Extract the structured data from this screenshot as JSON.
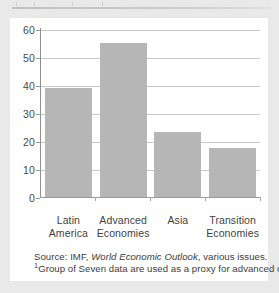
{
  "figure": {
    "background_color": "#e9e9e9",
    "panel_color": "#ffffff",
    "bar_color": "#b6b6b6",
    "gridline_color": "#c9c9c9",
    "axis_color": "#9b9b9b"
  },
  "notes": {
    "source_prefix": "Source: IMF, ",
    "source_title": "World Economic Outlook",
    "source_suffix": ", various issues.",
    "footnote_marker": "1",
    "footnote_text": "Group of Seven data are used as a proxy for advanced countries."
  },
  "chart_data": {
    "type": "bar",
    "title": "",
    "xlabel": "",
    "ylabel": "",
    "categories": [
      "Latin America",
      "Advanced Economies",
      "Asia",
      "Transition Economies"
    ],
    "category_lines": [
      [
        "Latin",
        "America"
      ],
      [
        "Advanced",
        "Economies"
      ],
      [
        "Asia",
        ""
      ],
      [
        "Transition",
        "Economies"
      ]
    ],
    "values": [
      39,
      55.5,
      23.5,
      17.5
    ],
    "ylim": [
      0,
      60
    ],
    "yticks": [
      0,
      10,
      20,
      30,
      40,
      50,
      60
    ],
    "ytick_labels": [
      "0",
      "10",
      "20",
      "30",
      "40",
      "50",
      "60"
    ],
    "grid": true,
    "legend": "none",
    "series": [
      {
        "name": "",
        "values": [
          39,
          55.5,
          23.5,
          17.5
        ]
      }
    ]
  }
}
